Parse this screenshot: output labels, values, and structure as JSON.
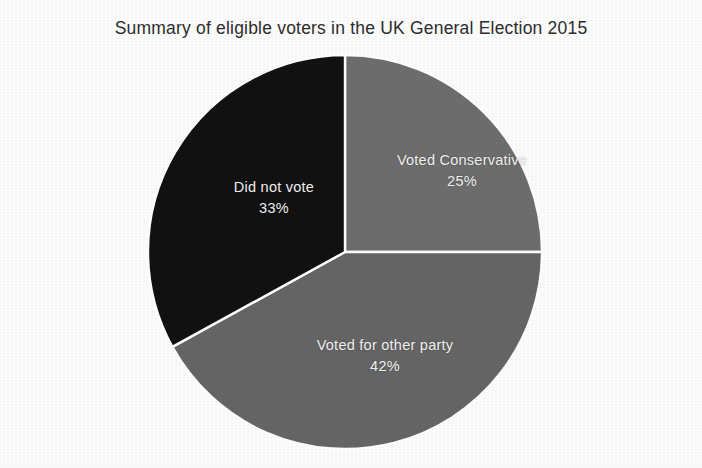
{
  "chart": {
    "title": "Summary of eligible voters in the UK General Election 2015"
  },
  "chart_data": {
    "type": "pie",
    "title": "Summary of eligible voters in the UK General Election 2015",
    "xlabel": "",
    "ylabel": "",
    "units": "percent",
    "start_angle_deg": 0,
    "direction": "clockwise",
    "legend": "none",
    "grid": false,
    "labels_inside_slices": true,
    "background_color": "#fdfdfd",
    "label_text_color": "#f2f2f2",
    "divider_color": "#ffffff",
    "categories": [
      "Voted Conservative",
      "Voted for other party",
      "Did not vote"
    ],
    "values": [
      25,
      42,
      33
    ],
    "colors": [
      "#6e6e6e",
      "#666666",
      "#121212"
    ],
    "slices": [
      {
        "name": "Voted Conservative",
        "value": 25,
        "value_label": "25%",
        "color": "#6e6e6e",
        "start_deg": 0,
        "end_deg": 90
      },
      {
        "name": "Voted for other party",
        "value": 42,
        "value_label": "42%",
        "color": "#666666",
        "start_deg": 90,
        "end_deg": 241.2
      },
      {
        "name": "Did not vote",
        "value": 33,
        "value_label": "33%",
        "color": "#121212",
        "start_deg": 241.2,
        "end_deg": 360
      }
    ]
  },
  "labels": {
    "conservative": {
      "name": "Voted Conservative",
      "pct": "25%"
    },
    "other_party": {
      "name": "Voted for other party",
      "pct": "42%"
    },
    "did_not_vote": {
      "name": "Did not vote",
      "pct": "33%"
    }
  }
}
